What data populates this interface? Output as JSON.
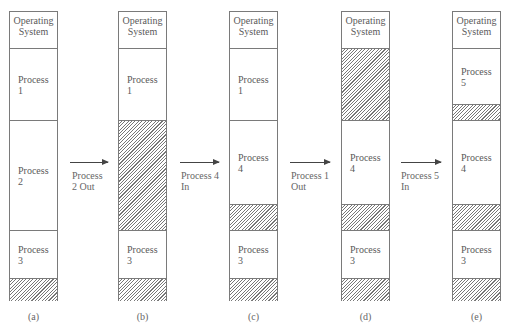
{
  "diagram": {
    "columns": [
      {
        "caption": "(a)",
        "segments": [
          {
            "type": "os",
            "label": "Operating\nSystem",
            "top": 0,
            "height": 37
          },
          {
            "type": "process",
            "label": "Process\n1",
            "top": 37,
            "height": 72
          },
          {
            "type": "process",
            "label": "Process\n2",
            "top": 109,
            "height": 110
          },
          {
            "type": "process",
            "label": "Process\n3",
            "top": 219,
            "height": 48
          },
          {
            "type": "free",
            "label": "",
            "top": 267,
            "height": 23
          }
        ]
      },
      {
        "caption": "(b)",
        "segments": [
          {
            "type": "os",
            "label": "Operating\nSystem",
            "top": 0,
            "height": 37
          },
          {
            "type": "process",
            "label": "Process\n1",
            "top": 37,
            "height": 72
          },
          {
            "type": "free",
            "label": "",
            "top": 109,
            "height": 110
          },
          {
            "type": "process",
            "label": "Process\n3",
            "top": 219,
            "height": 48
          },
          {
            "type": "free",
            "label": "",
            "top": 267,
            "height": 23
          }
        ]
      },
      {
        "caption": "(c)",
        "segments": [
          {
            "type": "os",
            "label": "Operating\nSystem",
            "top": 0,
            "height": 37
          },
          {
            "type": "process",
            "label": "Process\n1",
            "top": 37,
            "height": 72
          },
          {
            "type": "process",
            "label": "Process\n4",
            "top": 109,
            "height": 84
          },
          {
            "type": "free",
            "label": "",
            "top": 193,
            "height": 26
          },
          {
            "type": "process",
            "label": "Process\n3",
            "top": 219,
            "height": 48
          },
          {
            "type": "free",
            "label": "",
            "top": 267,
            "height": 23
          }
        ]
      },
      {
        "caption": "(d)",
        "segments": [
          {
            "type": "os",
            "label": "Operating\nSystem",
            "top": 0,
            "height": 37
          },
          {
            "type": "free",
            "label": "",
            "top": 37,
            "height": 72
          },
          {
            "type": "process",
            "label": "Process\n4",
            "top": 109,
            "height": 84
          },
          {
            "type": "free",
            "label": "",
            "top": 193,
            "height": 26
          },
          {
            "type": "process",
            "label": "Process\n3",
            "top": 219,
            "height": 48
          },
          {
            "type": "free",
            "label": "",
            "top": 267,
            "height": 23
          }
        ]
      },
      {
        "caption": "(e)",
        "segments": [
          {
            "type": "os",
            "label": "Operating\nSystem",
            "top": 0,
            "height": 37
          },
          {
            "type": "process",
            "label": "Process\n5",
            "top": 37,
            "height": 56
          },
          {
            "type": "free",
            "label": "",
            "top": 93,
            "height": 16
          },
          {
            "type": "process",
            "label": "Process\n4",
            "top": 109,
            "height": 84
          },
          {
            "type": "free",
            "label": "",
            "top": 193,
            "height": 26
          },
          {
            "type": "process",
            "label": "Process\n3",
            "top": 219,
            "height": 48
          },
          {
            "type": "free",
            "label": "",
            "top": 267,
            "height": 23
          }
        ]
      }
    ],
    "transitions": [
      {
        "label": "Process\n2 Out"
      },
      {
        "label": "Process 4\nIn"
      },
      {
        "label": "Process 1\nOut"
      },
      {
        "label": "Process 5\nIn"
      }
    ]
  }
}
